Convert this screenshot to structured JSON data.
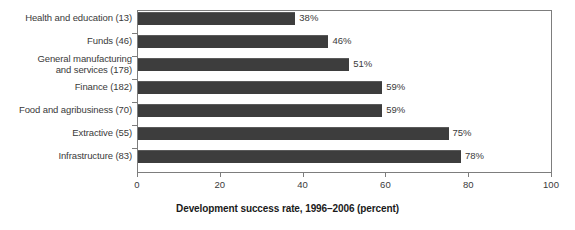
{
  "chart_data": {
    "type": "bar",
    "orientation": "horizontal",
    "title": "",
    "xlabel": "Development success rate, 1996–2006 (percent)",
    "ylabel": "",
    "xlim": [
      0,
      100
    ],
    "xticks": [
      0,
      20,
      40,
      60,
      80,
      100
    ],
    "xtick_labels": [
      "0",
      "20",
      "40",
      "60",
      "80",
      "100"
    ],
    "grid": false,
    "legend": null,
    "bar_color": "#3d3d3d",
    "categories": [
      "Health and education (13)",
      "Funds (46)",
      "General manufacturing\nand services (178)",
      "Finance (182)",
      "Food and agribusiness (70)",
      "Extractive (55)",
      "Infrastructure (83)"
    ],
    "values": [
      38,
      46,
      51,
      59,
      59,
      75,
      78
    ],
    "value_labels": [
      "38%",
      "46%",
      "51%",
      "59%",
      "59%",
      "75%",
      "78%"
    ]
  }
}
